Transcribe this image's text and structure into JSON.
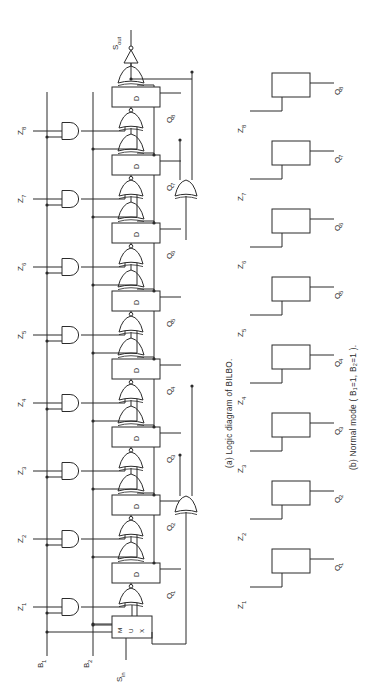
{
  "figure": {
    "background_color": "#ffffff",
    "line_color": "#2b2b2b",
    "orientation_note": "rotated-90-ccw",
    "captions": {
      "a": "(a) Logic diagram of BILBO.",
      "b": "(b) Normal mode ( B₁=1, B₂=1 )."
    }
  },
  "diagram_a": {
    "scan_out_label": "S",
    "scan_out_sub": "out",
    "scan_in_label": "S",
    "scan_in_sub": "in",
    "mux_label_letters": [
      "M",
      "U",
      "X"
    ],
    "control_bus": [
      {
        "label": "B",
        "sub": "1"
      },
      {
        "label": "B",
        "sub": "2"
      }
    ],
    "ff_letter": "D",
    "stages": [
      {
        "z_label": "Z",
        "z_sub": "1",
        "q_label": "Q",
        "q_sub": "1"
      },
      {
        "z_label": "Z",
        "z_sub": "2",
        "q_label": "Q",
        "q_sub": "2"
      },
      {
        "z_label": "Z",
        "z_sub": "3",
        "q_label": "Q",
        "q_sub": "3"
      },
      {
        "z_label": "Z",
        "z_sub": "4",
        "q_label": "Q",
        "q_sub": "4"
      },
      {
        "z_label": "Z",
        "z_sub": "5",
        "q_label": "Q",
        "q_sub": "5"
      },
      {
        "z_label": "Z",
        "z_sub": "6",
        "q_label": "Q",
        "q_sub": "6"
      },
      {
        "z_label": "Z",
        "z_sub": "7",
        "q_label": "Q",
        "q_sub": "7"
      },
      {
        "z_label": "Z",
        "z_sub": "8",
        "q_label": "Q",
        "q_sub": "8"
      }
    ]
  },
  "diagram_b": {
    "stages": [
      {
        "z_label": "Z",
        "z_sub": "1",
        "q_label": "Q",
        "q_sub": "1"
      },
      {
        "z_label": "Z",
        "z_sub": "2",
        "q_label": "Q",
        "q_sub": "2"
      },
      {
        "z_label": "Z",
        "z_sub": "3",
        "q_label": "Q",
        "q_sub": "3"
      },
      {
        "z_label": "Z",
        "z_sub": "4",
        "q_label": "Q",
        "q_sub": "4"
      },
      {
        "z_label": "Z",
        "z_sub": "5",
        "q_label": "Q",
        "q_sub": "5"
      },
      {
        "z_label": "Z",
        "z_sub": "6",
        "q_label": "Q",
        "q_sub": "6"
      },
      {
        "z_label": "Z",
        "z_sub": "7",
        "q_label": "Q",
        "q_sub": "7"
      },
      {
        "z_label": "Z",
        "z_sub": "8",
        "q_label": "Q",
        "q_sub": "8"
      }
    ]
  }
}
